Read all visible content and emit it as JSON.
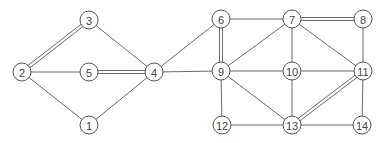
{
  "diagram": {
    "type": "undirected-graph",
    "node_radius": 9,
    "colors": {
      "edge": "#6a6a6a",
      "node_stroke": "#555555",
      "label": "#444444",
      "background": "#ffffff"
    },
    "nodes": [
      {
        "id": "1",
        "label": "1",
        "x": 89,
        "y": 125
      },
      {
        "id": "2",
        "label": "2",
        "x": 22,
        "y": 72
      },
      {
        "id": "3",
        "label": "3",
        "x": 89,
        "y": 20
      },
      {
        "id": "4",
        "label": "4",
        "x": 154,
        "y": 72
      },
      {
        "id": "5",
        "label": "5",
        "x": 89,
        "y": 72
      },
      {
        "id": "6",
        "label": "6",
        "x": 221,
        "y": 19
      },
      {
        "id": "7",
        "label": "7",
        "x": 292,
        "y": 19
      },
      {
        "id": "8",
        "label": "8",
        "x": 363,
        "y": 19
      },
      {
        "id": "9",
        "label": "9",
        "x": 221,
        "y": 71
      },
      {
        "id": "10",
        "label": "10",
        "x": 292,
        "y": 71
      },
      {
        "id": "11",
        "label": "11",
        "x": 363,
        "y": 71
      },
      {
        "id": "12",
        "label": "12",
        "x": 222,
        "y": 125
      },
      {
        "id": "13",
        "label": "13",
        "x": 292,
        "y": 125
      },
      {
        "id": "14",
        "label": "14",
        "x": 362,
        "y": 125
      }
    ],
    "edges": [
      {
        "from": "2",
        "to": "3",
        "double": true
      },
      {
        "from": "2",
        "to": "5",
        "double": false
      },
      {
        "from": "2",
        "to": "1",
        "double": false
      },
      {
        "from": "3",
        "to": "4",
        "double": false
      },
      {
        "from": "5",
        "to": "4",
        "double": true
      },
      {
        "from": "1",
        "to": "4",
        "double": false
      },
      {
        "from": "4",
        "to": "6",
        "double": false
      },
      {
        "from": "4",
        "to": "9",
        "double": false
      },
      {
        "from": "6",
        "to": "9",
        "double": true
      },
      {
        "from": "6",
        "to": "7",
        "double": false
      },
      {
        "from": "7",
        "to": "8",
        "double": true
      },
      {
        "from": "7",
        "to": "9",
        "double": false
      },
      {
        "from": "7",
        "to": "10",
        "double": false
      },
      {
        "from": "7",
        "to": "11",
        "double": false
      },
      {
        "from": "8",
        "to": "11",
        "double": false
      },
      {
        "from": "9",
        "to": "10",
        "double": false
      },
      {
        "from": "10",
        "to": "11",
        "double": false
      },
      {
        "from": "9",
        "to": "12",
        "double": false
      },
      {
        "from": "9",
        "to": "13",
        "double": false
      },
      {
        "from": "10",
        "to": "13",
        "double": false
      },
      {
        "from": "11",
        "to": "13",
        "double": true
      },
      {
        "from": "11",
        "to": "14",
        "double": false
      },
      {
        "from": "12",
        "to": "13",
        "double": false
      },
      {
        "from": "13",
        "to": "14",
        "double": false
      }
    ]
  }
}
